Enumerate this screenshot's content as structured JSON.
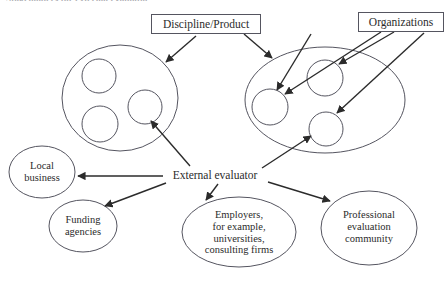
{
  "page": {
    "title": "Stakeholders for external evaluator",
    "background_color": "#ffffff",
    "stroke_color": "#555560",
    "text_color": "#2b2b2b",
    "width": 444,
    "height": 286
  },
  "boxes": [
    {
      "id": "discipline-product",
      "label": "Discipline/Product"
    },
    {
      "id": "organizations",
      "label": "Organizations"
    }
  ],
  "hub": {
    "id": "external-evaluator",
    "label": "External evaluator"
  },
  "ellipses": [
    {
      "id": "local-business",
      "label": "Local\nbusiness"
    },
    {
      "id": "funding-agencies",
      "label": "Funding\nagencies"
    },
    {
      "id": "employers",
      "label": "Employers,\nfor example,\nuniversities,\nconsulting firms"
    },
    {
      "id": "professional-evaluation-community",
      "label": "Professional\nevaluation\ncommunity"
    }
  ],
  "clusters": [
    {
      "id": "left-cluster",
      "label": "",
      "inner_count": 3
    },
    {
      "id": "right-cluster",
      "label": "",
      "inner_count": 3
    }
  ],
  "connections": [
    {
      "from": "discipline-product",
      "to": "left-cluster",
      "arrow": true
    },
    {
      "from": "discipline-product",
      "to": "right-cluster",
      "arrow": true
    },
    {
      "from": "discipline-product",
      "to": "right-cluster-inner-left",
      "arrow": true
    },
    {
      "from": "organizations",
      "to": "right-cluster-inner-left",
      "arrow": true
    },
    {
      "from": "organizations",
      "to": "right-cluster-inner-top",
      "arrow": true
    },
    {
      "from": "organizations",
      "to": "right-cluster-inner-bottom",
      "arrow": true
    },
    {
      "from": "external-evaluator",
      "to": "left-cluster-inner-right",
      "arrow": true
    },
    {
      "from": "external-evaluator",
      "to": "right-cluster-inner-bottom",
      "arrow": true
    },
    {
      "from": "external-evaluator",
      "to": "local-business",
      "arrow": true
    },
    {
      "from": "external-evaluator",
      "to": "funding-agencies",
      "arrow": true
    },
    {
      "from": "external-evaluator",
      "to": "employers",
      "arrow": true
    },
    {
      "from": "external-evaluator",
      "to": "professional-evaluation-community",
      "arrow": true
    }
  ]
}
